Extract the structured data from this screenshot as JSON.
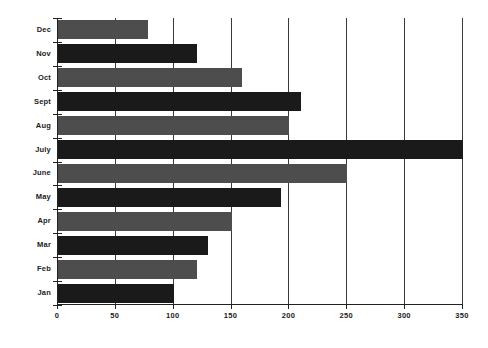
{
  "chart_data": {
    "type": "bar",
    "orientation": "horizontal",
    "title": "",
    "subtitle": "",
    "xlabel": "",
    "ylabel": "",
    "categories": [
      "Dec",
      "Nov",
      "Oct",
      "Sept",
      "Aug",
      "July",
      "June",
      "May",
      "Apr",
      "Mar",
      "Feb",
      "Jan"
    ],
    "values": [
      78,
      120,
      159,
      210,
      200,
      350,
      250,
      193,
      150,
      130,
      120,
      100
    ],
    "xlim": [
      0,
      350
    ],
    "xticks": [
      0,
      50,
      100,
      150,
      200,
      250,
      300,
      350
    ],
    "xtick_labels": [
      "0",
      "50",
      "100",
      "150",
      "200",
      "250",
      "300",
      "350"
    ],
    "grid": "vertical",
    "legend": "none",
    "bar_colors": [
      "#4d4d4d",
      "#1a1a1a",
      "#4d4d4d",
      "#1a1a1a",
      "#4d4d4d",
      "#1a1a1a",
      "#4d4d4d",
      "#1a1a1a",
      "#4d4d4d",
      "#1a1a1a",
      "#4d4d4d",
      "#1a1a1a"
    ],
    "series": [
      {
        "name": "Monthly value",
        "values": [
          78,
          120,
          159,
          210,
          200,
          350,
          250,
          193,
          150,
          130,
          120,
          100
        ]
      }
    ],
    "colors": {
      "background": "#ffffff",
      "axis": "#222222",
      "grid": "#3a3a3a",
      "bar_light": "#4d4d4d",
      "bar_dark": "#1a1a1a",
      "text": "#1c1c1c"
    }
  }
}
